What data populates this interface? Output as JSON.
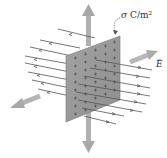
{
  "diagram": {
    "labels": {
      "charge_density_symbol": "σ",
      "charge_density_units": " C/m²",
      "field_symbol": "E",
      "field_vector_mark": "→"
    },
    "sheet": {
      "fill": "#9a9a9a",
      "charge_sign": "+",
      "rows": 8,
      "cols": 5
    },
    "colors": {
      "field_line": "#555555",
      "axis_arrow": "#a8a8a8",
      "background": "#ffffff"
    }
  }
}
